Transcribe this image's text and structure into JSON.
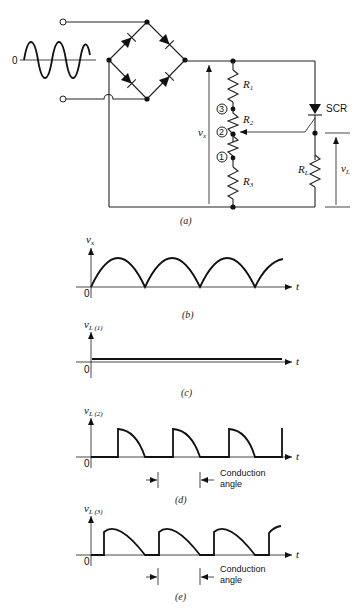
{
  "figure": {
    "panels": [
      {
        "id": "a",
        "caption": "(a)"
      },
      {
        "id": "b",
        "caption": "(b)"
      },
      {
        "id": "c",
        "caption": "(c)"
      },
      {
        "id": "d",
        "caption": "(d)"
      },
      {
        "id": "e",
        "caption": "(e)"
      }
    ]
  },
  "circuit": {
    "source_zero_label": "0",
    "components": {
      "r1": "R",
      "r1_sub": "1",
      "r2": "R",
      "r2_sub": "2",
      "r3": "R",
      "r3_sub": "3",
      "rl": "R",
      "rl_sub": "L",
      "scr": "SCR"
    },
    "taps": [
      "3",
      "2",
      "1"
    ],
    "vx_label": "v",
    "vx_sub": "x",
    "vl_label": "v",
    "vl_sub": "L"
  },
  "plots": {
    "b": {
      "ylabel": "v",
      "ylabel_sub": "x",
      "origin": "0",
      "xlabel": "t"
    },
    "c": {
      "ylabel": "v",
      "ylabel_sub": "L (1)",
      "origin": "0",
      "xlabel": "t"
    },
    "d": {
      "ylabel": "v",
      "ylabel_sub": "L (2)",
      "origin": "0",
      "xlabel": "t",
      "annotation_line1": "Conduction",
      "annotation_line2": "angle"
    },
    "e": {
      "ylabel": "v",
      "ylabel_sub": "L (3)",
      "origin": "0",
      "xlabel": "t",
      "annotation_line1": "Conduction",
      "annotation_line2": "angle"
    }
  }
}
